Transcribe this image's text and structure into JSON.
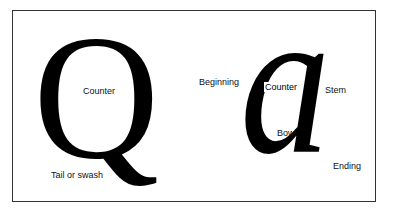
{
  "figure": {
    "glyphs": {
      "q": "Q",
      "a": "a"
    },
    "labels": {
      "q_counter": "Counter",
      "q_tail": "Tail or swash",
      "a_beginning": "Beginning",
      "a_counter": "Counter",
      "a_stem": "Stem",
      "a_bowl": "Bowl",
      "a_ending": "Ending"
    },
    "colors": {
      "ink": "#000000",
      "background": "#ffffff",
      "frame": "#333333"
    }
  }
}
